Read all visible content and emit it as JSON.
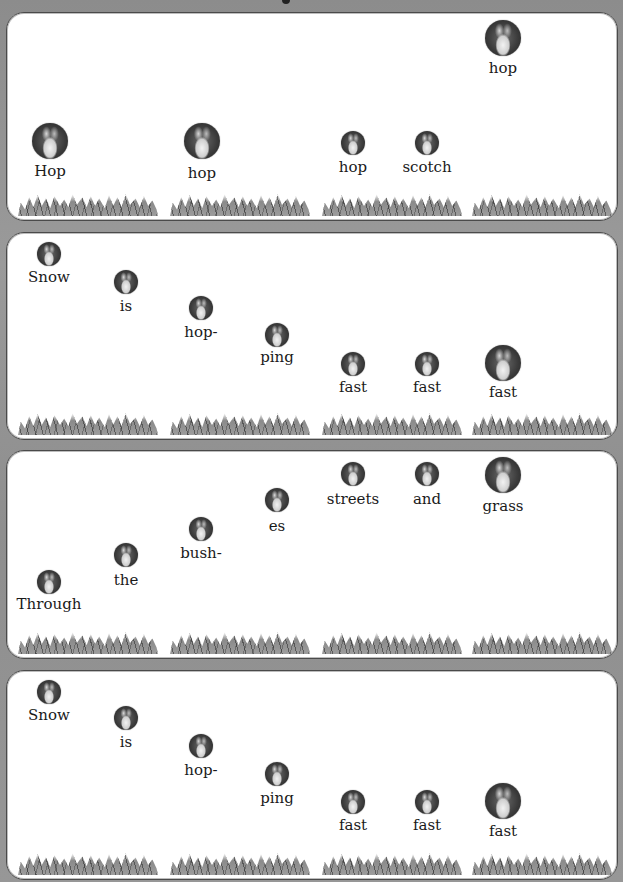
{
  "colors": {
    "background": "#929292",
    "panel": "#ffffff",
    "panel_border": "#4a4a4a",
    "text": "#1a1a1a"
  },
  "panels": [
    {
      "name": "panel-1",
      "top": 12,
      "height": 207,
      "words": [
        {
          "label": "Hop",
          "x": 50,
          "icon_top": 123,
          "icon_size": 36,
          "label_top": 162
        },
        {
          "label": "hop",
          "x": 202,
          "icon_top": 123,
          "icon_size": 36,
          "label_top": 164
        },
        {
          "label": "hop",
          "x": 353,
          "icon_top": 131,
          "icon_size": 24,
          "label_top": 158
        },
        {
          "label": "scotch",
          "x": 427,
          "icon_top": 131,
          "icon_size": 24,
          "label_top": 158
        },
        {
          "label": "hop",
          "x": 503,
          "icon_top": 20,
          "icon_size": 36,
          "label_top": 59
        }
      ]
    },
    {
      "name": "panel-2",
      "top": 232,
      "height": 206,
      "words": [
        {
          "label": "Snow",
          "x": 49,
          "icon_top": 242,
          "icon_size": 24,
          "label_top": 268
        },
        {
          "label": "is",
          "x": 126,
          "icon_top": 270,
          "icon_size": 24,
          "label_top": 297
        },
        {
          "label": "hop-",
          "x": 201,
          "icon_top": 296,
          "icon_size": 24,
          "label_top": 323
        },
        {
          "label": "ping",
          "x": 277,
          "icon_top": 323,
          "icon_size": 24,
          "label_top": 348
        },
        {
          "label": "fast",
          "x": 353,
          "icon_top": 352,
          "icon_size": 24,
          "label_top": 378
        },
        {
          "label": "fast",
          "x": 427,
          "icon_top": 352,
          "icon_size": 24,
          "label_top": 378
        },
        {
          "label": "fast",
          "x": 503,
          "icon_top": 345,
          "icon_size": 36,
          "label_top": 383
        }
      ]
    },
    {
      "name": "panel-3",
      "top": 450,
      "height": 207,
      "words": [
        {
          "label": "Through",
          "x": 49,
          "icon_top": 570,
          "icon_size": 24,
          "label_top": 595
        },
        {
          "label": "the",
          "x": 126,
          "icon_top": 543,
          "icon_size": 24,
          "label_top": 571
        },
        {
          "label": "bush-",
          "x": 201,
          "icon_top": 517,
          "icon_size": 24,
          "label_top": 544
        },
        {
          "label": "es",
          "x": 277,
          "icon_top": 488,
          "icon_size": 24,
          "label_top": 517
        },
        {
          "label": "streets",
          "x": 353,
          "icon_top": 462,
          "icon_size": 24,
          "label_top": 490
        },
        {
          "label": "and",
          "x": 427,
          "icon_top": 462,
          "icon_size": 24,
          "label_top": 490
        },
        {
          "label": "grass",
          "x": 503,
          "icon_top": 457,
          "icon_size": 36,
          "label_top": 497
        }
      ]
    },
    {
      "name": "panel-4",
      "top": 670,
      "height": 208,
      "words": [
        {
          "label": "Snow",
          "x": 49,
          "icon_top": 680,
          "icon_size": 24,
          "label_top": 706
        },
        {
          "label": "is",
          "x": 126,
          "icon_top": 706,
          "icon_size": 24,
          "label_top": 733
        },
        {
          "label": "hop-",
          "x": 201,
          "icon_top": 734,
          "icon_size": 24,
          "label_top": 761
        },
        {
          "label": "ping",
          "x": 277,
          "icon_top": 762,
          "icon_size": 24,
          "label_top": 789
        },
        {
          "label": "fast",
          "x": 353,
          "icon_top": 790,
          "icon_size": 24,
          "label_top": 816
        },
        {
          "label": "fast",
          "x": 427,
          "icon_top": 790,
          "icon_size": 24,
          "label_top": 816
        },
        {
          "label": "fast",
          "x": 503,
          "icon_top": 783,
          "icon_size": 36,
          "label_top": 822
        }
      ]
    }
  ],
  "grass_segments_x": [
    18,
    170,
    322,
    472
  ]
}
